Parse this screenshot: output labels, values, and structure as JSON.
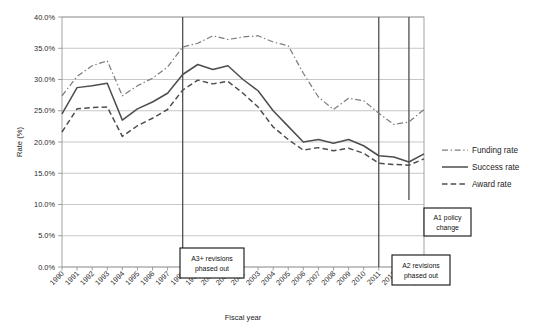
{
  "chart_data": {
    "type": "line",
    "title": "",
    "xlabel": "Fiscal year",
    "ylabel": "Rate (%)",
    "ylim": [
      0,
      40
    ],
    "ytick_labels": [
      "0.0%",
      "5.0%",
      "10.0%",
      "15.0%",
      "20.0%",
      "25.0%",
      "30.0%",
      "35.0%",
      "40.0%"
    ],
    "ytick_values": [
      0,
      5,
      10,
      15,
      20,
      25,
      30,
      35,
      40
    ],
    "grid": "horizontal",
    "legend_position": "right",
    "categories": [
      "1990",
      "1991",
      "1992",
      "1993",
      "1994",
      "1995",
      "1996",
      "1997",
      "1998",
      "1999",
      "2000",
      "2001",
      "2002",
      "2003",
      "2004",
      "2005",
      "2006",
      "2007",
      "2008",
      "2009",
      "2010",
      "2011",
      "2012",
      "2013",
      "2014"
    ],
    "series": [
      {
        "name": "Funding rate",
        "style": "dash-dot",
        "values": [
          27.4,
          30.5,
          32.2,
          33.0,
          27.4,
          29.0,
          30.2,
          32.0,
          35.2,
          35.8,
          37.0,
          36.4,
          36.8,
          37.0,
          36.0,
          35.4,
          31.0,
          27.2,
          25.2,
          27.0,
          26.6,
          24.6,
          22.8,
          23.2,
          25.2
        ]
      },
      {
        "name": "Success rate",
        "style": "solid",
        "values": [
          24.5,
          28.7,
          29.0,
          29.4,
          23.5,
          25.3,
          26.4,
          27.8,
          30.8,
          32.4,
          31.6,
          32.2,
          30.0,
          28.2,
          25.0,
          22.5,
          20.0,
          20.4,
          19.8,
          20.4,
          19.4,
          17.8,
          17.6,
          16.8,
          18.1
        ]
      },
      {
        "name": "Award rate",
        "style": "dashed",
        "values": [
          21.6,
          25.3,
          25.5,
          25.6,
          20.9,
          22.6,
          23.8,
          25.2,
          28.3,
          29.9,
          29.3,
          29.7,
          27.8,
          25.6,
          22.4,
          20.4,
          18.7,
          19.1,
          18.6,
          19.0,
          18.2,
          16.6,
          16.4,
          16.3,
          17.3
        ]
      }
    ],
    "annotations": [
      {
        "id": "a3-revisions",
        "label_line1": "A3+ revisions",
        "label_line2": "phased out",
        "at_year": "1998"
      },
      {
        "id": "a2-revisions",
        "label_line1": "A2 revisions",
        "label_line2": "phased out",
        "at_year": "2011"
      },
      {
        "id": "a1-policy",
        "label_line1": "A1 policy",
        "label_line2": "change",
        "at_year": "2013"
      }
    ]
  },
  "colors": {
    "success": "#4d4d4d",
    "award": "#4d4d4d",
    "funding": "#7d7d7d",
    "grid": "#b9b9b9",
    "event_line": "#555555",
    "background": "#ffffff"
  }
}
